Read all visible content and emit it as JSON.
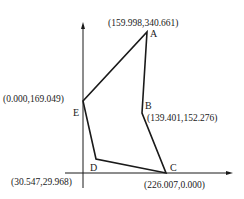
{
  "diagram": {
    "type": "polygon-on-axes",
    "points": [
      {
        "name": "A",
        "coord_label": "(159.998,340.661)"
      },
      {
        "name": "B",
        "coord_label": "(139.401,152.276)"
      },
      {
        "name": "C",
        "coord_label": "(226.007,0.000)"
      },
      {
        "name": "D",
        "coord_label": "(30.547,29.968)"
      },
      {
        "name": "E",
        "coord_label": "(0.000,169.049)"
      }
    ],
    "edges": [
      "A-B",
      "B-C",
      "C-D",
      "D-E",
      "E-A"
    ],
    "axes": {
      "x": "horizontal arrow",
      "y": "vertical arrow"
    },
    "colors": {
      "line": "#1a1a1a",
      "background": "#ffffff"
    }
  }
}
